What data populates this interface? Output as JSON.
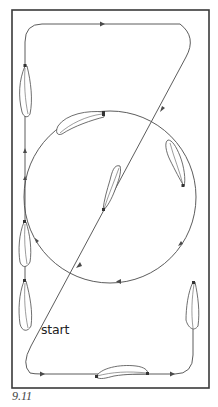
{
  "figure": {
    "caption": "9.11",
    "start_label": "start",
    "colors": {
      "frame": "#3a3a3a",
      "track": "#4a4a4a",
      "background": "#ffffff"
    },
    "elements": {
      "outer_frame": "rectangular arena border",
      "track_path": "rounded rectangular loop with diagonal crossing",
      "circle": "circular path inside arena",
      "feathers": 9,
      "direction_arrows": 10
    }
  }
}
